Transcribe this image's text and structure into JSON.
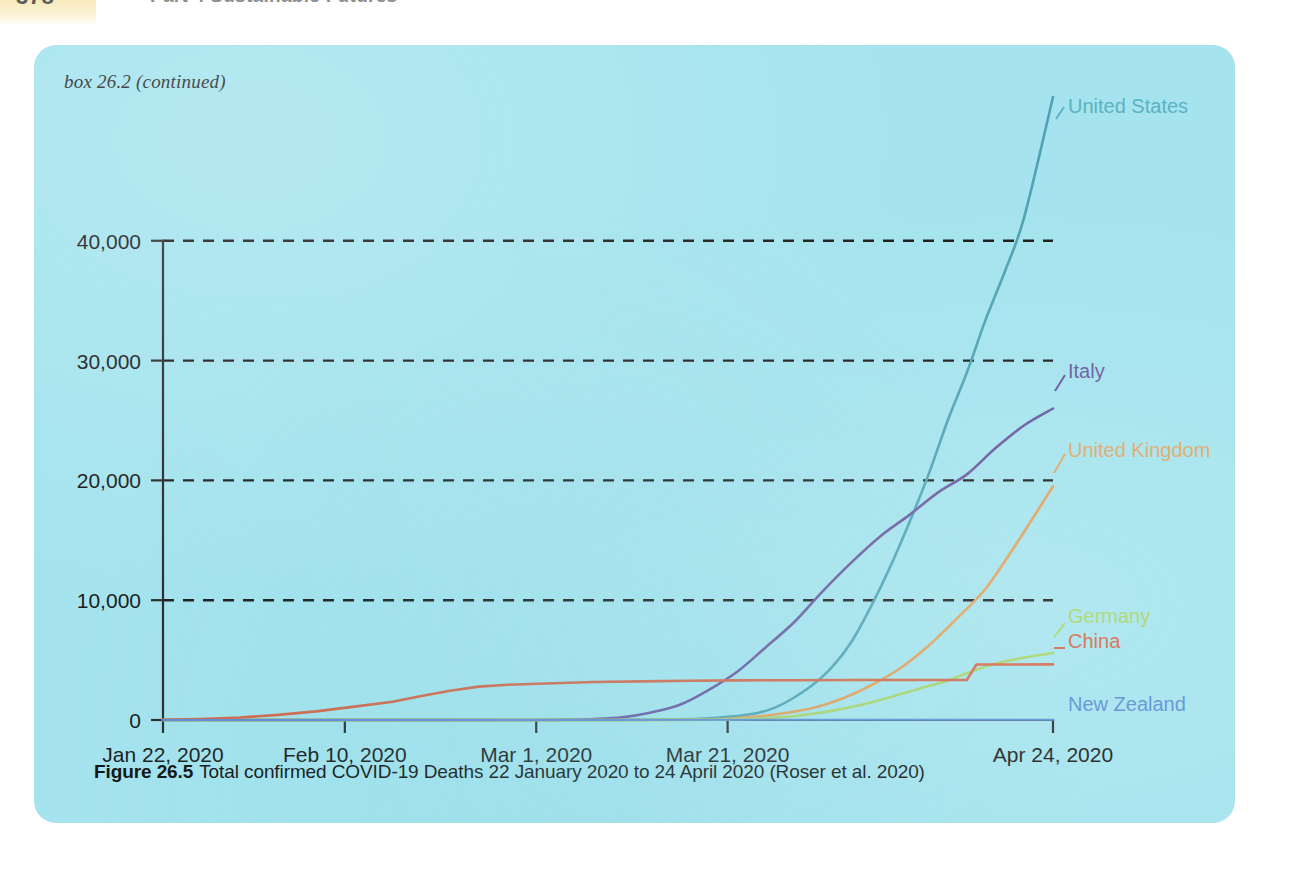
{
  "page_header": {
    "folio": "378",
    "running_head": "Part 4  Sustainable Futures"
  },
  "box": {
    "label": "box 26.2 (continued)",
    "background_color": "#a5e4ee"
  },
  "figure_caption": {
    "number": "Figure 26.5",
    "text": "Total confirmed COVID-19 Deaths 22 January 2020 to 24 April 2020 (Roser et al. 2020)"
  },
  "chart_data": {
    "type": "line",
    "title": "Total confirmed COVID-19 Deaths 22 January 2020 to 24 April 2020",
    "xlabel": "",
    "ylabel": "",
    "grid": "horizontal-dashed",
    "legend_position": "right-inline-labels",
    "xlim": [
      0,
      93
    ],
    "ylim": [
      0,
      52000
    ],
    "yticks": [
      0,
      10000,
      20000,
      30000,
      40000
    ],
    "ytick_labels": [
      "0",
      "10,000",
      "20,000",
      "30,000",
      "40,000"
    ],
    "xticks": [
      0,
      19,
      39,
      59,
      93
    ],
    "xtick_labels": [
      "Jan 22, 2020",
      "Feb 10, 2020",
      "Mar 1, 2020",
      "Mar 21, 2020",
      "Apr 24, 2020"
    ],
    "x_unit": "days since 22 January 2020",
    "series": [
      {
        "name": "United States",
        "color": "#4fa3b4",
        "label_color": "#5bb2c2",
        "x": [
          0,
          19,
          39,
          47,
          52,
          56,
          59,
          62,
          64,
          66,
          68,
          70,
          72,
          74,
          76,
          78,
          80,
          82,
          84,
          86,
          88,
          90,
          93
        ],
        "values": [
          0,
          0,
          1,
          12,
          40,
          100,
          260,
          560,
          1050,
          1900,
          3000,
          4500,
          6600,
          9500,
          12800,
          16500,
          20500,
          25000,
          29000,
          33500,
          37500,
          42000,
          52000
        ]
      },
      {
        "name": "Italy",
        "color": "#6a5aa0",
        "label_color": "#6a5aa0",
        "x": [
          0,
          19,
          33,
          39,
          42,
          45,
          48,
          51,
          54,
          57,
          60,
          63,
          66,
          69,
          72,
          75,
          78,
          81,
          84,
          87,
          90,
          93
        ],
        "values": [
          0,
          0,
          0,
          2,
          21,
          80,
          230,
          630,
          1270,
          2500,
          4030,
          6080,
          8200,
          10800,
          13200,
          15360,
          17120,
          19000,
          20500,
          22700,
          24600,
          26000
        ]
      },
      {
        "name": "United Kingdom",
        "color": "#e2a05a",
        "label_color": "#e0a96a",
        "x": [
          0,
          19,
          39,
          48,
          52,
          56,
          59,
          62,
          65,
          68,
          71,
          74,
          77,
          80,
          83,
          86,
          89,
          93
        ],
        "values": [
          0,
          0,
          0,
          2,
          10,
          35,
          110,
          290,
          580,
          1020,
          1800,
          2900,
          4300,
          6200,
          8500,
          11000,
          14500,
          19500
        ]
      },
      {
        "name": "Germany",
        "color": "#a8d46a",
        "label_color": "#a8d46a",
        "x": [
          0,
          19,
          39,
          50,
          55,
          58,
          61,
          64,
          67,
          70,
          73,
          76,
          79,
          82,
          85,
          88,
          93
        ],
        "values": [
          0,
          0,
          0,
          2,
          12,
          35,
          90,
          200,
          420,
          780,
          1280,
          1900,
          2600,
          3300,
          4200,
          4900,
          5600
        ]
      },
      {
        "name": "China",
        "color": "#d4684a",
        "label_color": "#d4684a",
        "x": [
          0,
          4,
          8,
          12,
          16,
          20,
          24,
          27,
          30,
          33,
          36,
          40,
          45,
          50,
          55,
          60,
          66,
          72,
          78,
          84,
          85,
          88,
          93
        ],
        "values": [
          17,
          80,
          213,
          425,
          722,
          1115,
          1523,
          2000,
          2443,
          2788,
          2942,
          3045,
          3169,
          3226,
          3277,
          3305,
          3322,
          3335,
          3342,
          3349,
          4632,
          4636,
          4640
        ]
      },
      {
        "name": "New Zealand",
        "color": "#5b8fd4",
        "label_color": "#5b8fd4",
        "x": [
          0,
          93
        ],
        "values": [
          0,
          18
        ]
      }
    ]
  }
}
